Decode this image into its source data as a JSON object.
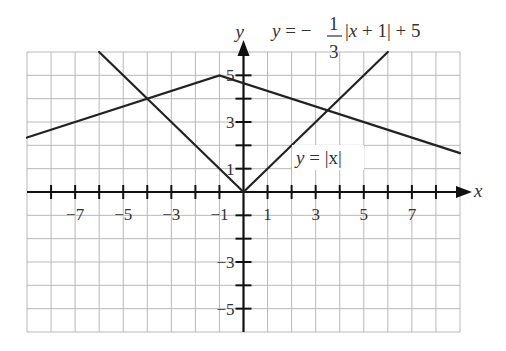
{
  "chart_data": {
    "type": "line",
    "title": "",
    "xlabel": "x",
    "ylabel": "y",
    "xlim": [
      -9,
      9
    ],
    "ylim": [
      -6,
      6
    ],
    "grid": true,
    "x_tick_labels": [
      {
        "value": -7,
        "label": "−7"
      },
      {
        "value": -5,
        "label": "−5"
      },
      {
        "value": -3,
        "label": "−3"
      },
      {
        "value": -1,
        "label": "−1"
      },
      {
        "value": 1,
        "label": "1"
      },
      {
        "value": 3,
        "label": "3"
      },
      {
        "value": 5,
        "label": "5"
      },
      {
        "value": 7,
        "label": "7"
      }
    ],
    "y_tick_labels": [
      {
        "value": 5,
        "label": "5"
      },
      {
        "value": 3,
        "label": "3"
      },
      {
        "value": 1,
        "label": "1"
      },
      {
        "value": -3,
        "label": "−3"
      },
      {
        "value": -5,
        "label": "−5"
      }
    ],
    "series": [
      {
        "name": "y = |x|",
        "equation": "y = |x|",
        "points": [
          [
            -6,
            6
          ],
          [
            0,
            0
          ],
          [
            6,
            6
          ]
        ]
      },
      {
        "name": "y = -1/3|x + 1| + 5",
        "equation": "y = −(1/3)|x + 1| + 5",
        "points": [
          [
            -9,
            2.333
          ],
          [
            -1,
            5
          ],
          [
            9,
            1.667
          ]
        ]
      }
    ],
    "annotations": {
      "eq1": {
        "y": "y",
        "eq": " = ",
        "abs": "|x|"
      },
      "eq2": {
        "y": "y",
        "eq": " = −",
        "num": "1",
        "den": "3",
        "abs_open": "|",
        "x": "x",
        "rest": " + 1|  + 5"
      }
    }
  }
}
